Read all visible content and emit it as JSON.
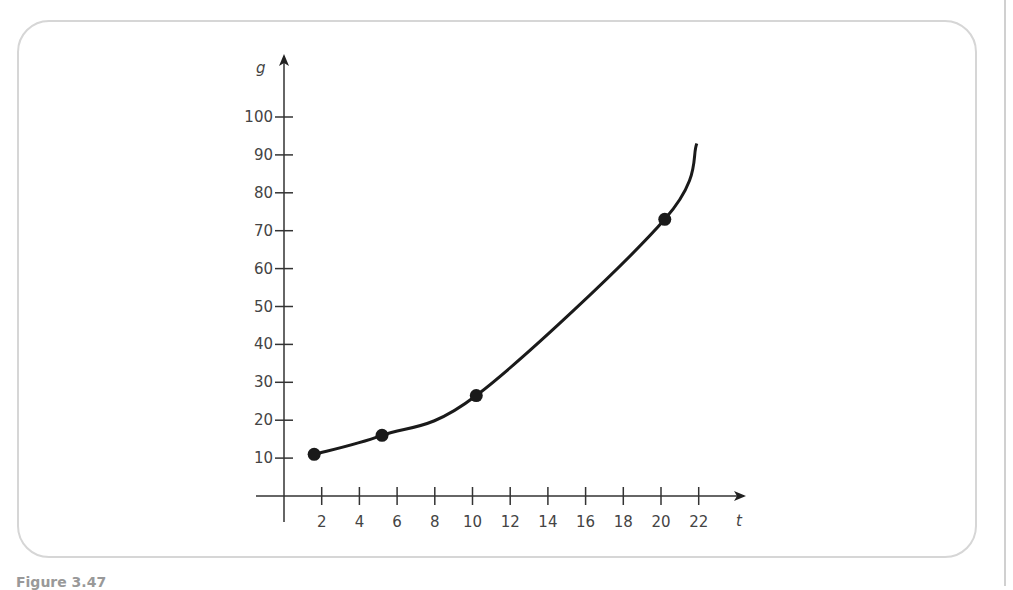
{
  "chart_data": {
    "type": "line",
    "title": "",
    "xlabel": "t",
    "ylabel": "g",
    "x_ticks": [
      2,
      4,
      6,
      8,
      10,
      12,
      14,
      16,
      18,
      20,
      22
    ],
    "y_ticks": [
      10,
      20,
      30,
      40,
      50,
      60,
      70,
      80,
      90,
      100
    ],
    "xlim": [
      0,
      24
    ],
    "ylim": [
      0,
      105
    ],
    "grid": false,
    "legend": null,
    "series": [
      {
        "name": "g(t)",
        "style": "smooth exponential curve with marked points",
        "points": [
          {
            "t": 1.6,
            "g": 11
          },
          {
            "t": 5.2,
            "g": 16
          },
          {
            "t": 10.2,
            "g": 26.5
          },
          {
            "t": 20.2,
            "g": 73
          }
        ],
        "curve_end": {
          "t": 21.9,
          "g": 93
        }
      }
    ]
  },
  "figure": {
    "caption": "Figure 3.47"
  }
}
